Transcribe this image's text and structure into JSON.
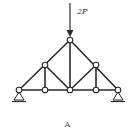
{
  "figure": {
    "load_label": "2P",
    "caption": "A"
  },
  "truss": {
    "nodes": [
      {
        "id": "left-support",
        "x": 19,
        "y": 90
      },
      {
        "id": "bottom-left",
        "x": 45,
        "y": 90
      },
      {
        "id": "bottom-center",
        "x": 70,
        "y": 90
      },
      {
        "id": "bottom-right",
        "x": 96,
        "y": 90
      },
      {
        "id": "right-support",
        "x": 118,
        "y": 90
      },
      {
        "id": "upper-left",
        "x": 45,
        "y": 65
      },
      {
        "id": "apex",
        "x": 70,
        "y": 40
      },
      {
        "id": "upper-right",
        "x": 96,
        "y": 65
      }
    ],
    "supports": [
      "left-pin",
      "right-pin"
    ],
    "load": {
      "at": "apex",
      "direction": "down",
      "magnitude": "2P"
    },
    "colors": {
      "line": "#2a2a2a",
      "background": "#ffffff"
    }
  }
}
